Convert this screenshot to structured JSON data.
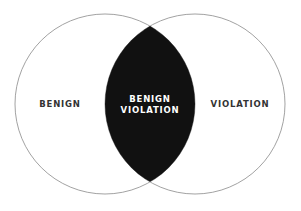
{
  "diagram": {
    "type": "venn",
    "sets": [
      {
        "label": "BENIGN"
      },
      {
        "label": "VIOLATION"
      }
    ],
    "intersection": {
      "line1": "BENIGN",
      "line2": "VIOLATION"
    },
    "colors": {
      "background": "#ffffff",
      "outline": "#8a8a8a",
      "intersection_fill": "#111111",
      "text_dark": "#333333",
      "text_light": "#ffffff"
    }
  }
}
